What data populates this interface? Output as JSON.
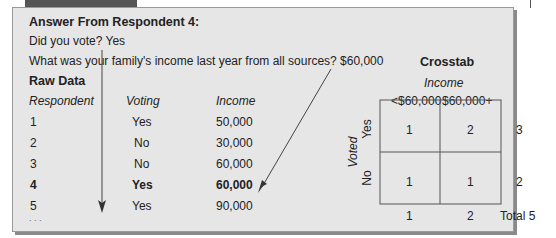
{
  "answer": {
    "title": "Answer From Respondent 4:",
    "q1": "Did you vote? Yes",
    "q2": "What was your family's income last year from all sources? $60,000"
  },
  "raw_data": {
    "title": "Raw Data",
    "headers": [
      "Respondent",
      "Voting",
      "Income"
    ],
    "rows": [
      {
        "respondent": "1",
        "voting": "Yes",
        "income": "50,000"
      },
      {
        "respondent": "2",
        "voting": "No",
        "income": "30,000"
      },
      {
        "respondent": "3",
        "voting": "No",
        "income": "60,000"
      },
      {
        "respondent": "4",
        "voting": "Yes",
        "income": "60,000",
        "highlight": true
      },
      {
        "respondent": "5",
        "voting": "Yes",
        "income": "90,000"
      }
    ],
    "ellipsis": ". . ."
  },
  "crosstab": {
    "title": "Crosstab",
    "col_var": "Income",
    "col_labels": [
      "<$60,000",
      "$60,000+"
    ],
    "row_var": "Voted",
    "row_labels": [
      "Yes",
      "No"
    ],
    "cells": [
      [
        "1",
        "2"
      ],
      [
        "1",
        "1"
      ]
    ],
    "row_totals": [
      "3",
      "2"
    ],
    "col_totals": [
      "1",
      "2"
    ],
    "grand_total": "Total 5"
  }
}
